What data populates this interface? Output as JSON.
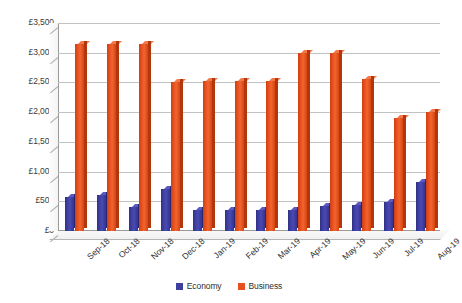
{
  "chart_data": {
    "type": "bar",
    "title": "",
    "subtitle": "",
    "xlabel": "",
    "ylabel": "",
    "ylim": [
      0,
      3500
    ],
    "ytick_step": 500,
    "grid": true,
    "legend_position": "bottom-center",
    "currency_symbol": "£",
    "categories": [
      "Sep-18",
      "Oct-18",
      "Nov-18",
      "Dec-18",
      "Jan-19",
      "Feb-19",
      "Mar-19",
      "Apr-19",
      "May-19",
      "Jun-19",
      "Jul-19",
      "Aug-19"
    ],
    "ytick_labels": [
      "£0",
      "£500",
      "£1,000",
      "£1,500",
      "£2,000",
      "£2,500",
      "£3,000",
      "£3,500"
    ],
    "ytick_values": [
      0,
      500,
      1000,
      1500,
      2000,
      2500,
      3000,
      3500
    ],
    "series": [
      {
        "name": "Economy",
        "color": "#3f3fa0",
        "values": [
          570,
          600,
          400,
          700,
          350,
          350,
          360,
          355,
          420,
          440,
          490,
          830
        ]
      },
      {
        "name": "Business",
        "color": "#e8511f",
        "values": [
          3150,
          3150,
          3150,
          2510,
          2520,
          2520,
          2520,
          3000,
          3000,
          2550,
          1900,
          2000
        ]
      }
    ]
  },
  "legend": {
    "items": [
      {
        "label": "Economy",
        "color": "#3f3fa0"
      },
      {
        "label": "Business",
        "color": "#e8511f"
      }
    ]
  }
}
